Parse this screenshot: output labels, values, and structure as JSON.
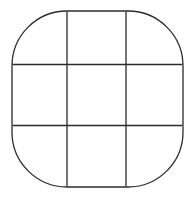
{
  "canvas": {
    "width": 194,
    "height": 199,
    "background_color": "#ffffff"
  },
  "figure": {
    "title": "rounded square divided into a three by three grid",
    "shape_kind": "rounded-square",
    "stroke_color": "#2b2b2b",
    "fill_color": "#ffffff",
    "stroke_width": 1.3,
    "outline": {
      "x": 12,
      "y": 11,
      "width": 171,
      "height": 176,
      "corner_radius": 55
    },
    "grid": {
      "rows": 3,
      "columns": 3,
      "cell_count": 9,
      "vertical_line_x": [
        67,
        126
      ],
      "horizontal_line_y": [
        64.5,
        125.5
      ],
      "line_color": "#2b2b2b",
      "line_width": 1.3
    }
  },
  "chart_data": {
    "type": "table",
    "title": "",
    "xlabel": "",
    "ylabel": "",
    "categories": [
      "column-1",
      "column-2",
      "column-3"
    ],
    "rows": [
      "row-1",
      "row-2",
      "row-3"
    ],
    "values": [
      [
        "",
        "",
        ""
      ],
      [
        "",
        "",
        ""
      ],
      [
        "",
        "",
        ""
      ]
    ],
    "grid": true,
    "legend": "none"
  }
}
